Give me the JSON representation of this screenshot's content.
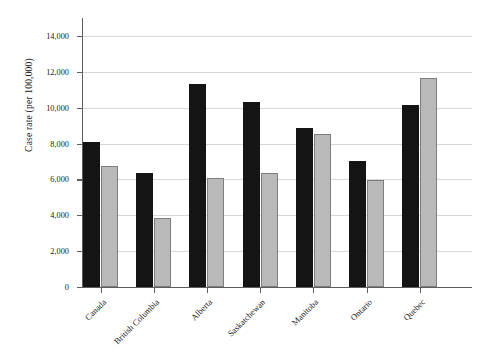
{
  "chart_data": {
    "type": "bar",
    "title": "",
    "xlabel": "",
    "ylabel": "Case rate (per 100,000)",
    "categories": [
      "Canada",
      "British Columbia",
      "Alberta",
      "Saskatchewan",
      "Manitoba",
      "Ontario",
      "Quebec"
    ],
    "series": [
      {
        "name": "series-dark",
        "color": "#141414",
        "values": [
          8100,
          6350,
          11300,
          10300,
          8850,
          7000,
          10150
        ]
      },
      {
        "name": "series-light",
        "color": "#b9b9b9",
        "values": [
          6750,
          3850,
          6100,
          6350,
          8550,
          5950,
          11650
        ]
      }
    ],
    "ylim": [
      0,
      15000
    ],
    "yticks": [
      0,
      2000,
      4000,
      6000,
      8000,
      10000,
      12000,
      14000
    ],
    "ytick_labels": [
      "0",
      "2,000",
      "4,000",
      "6,000",
      "8,000",
      "10,000",
      "12,000",
      "14,000"
    ],
    "grid": true,
    "legend": "none"
  }
}
